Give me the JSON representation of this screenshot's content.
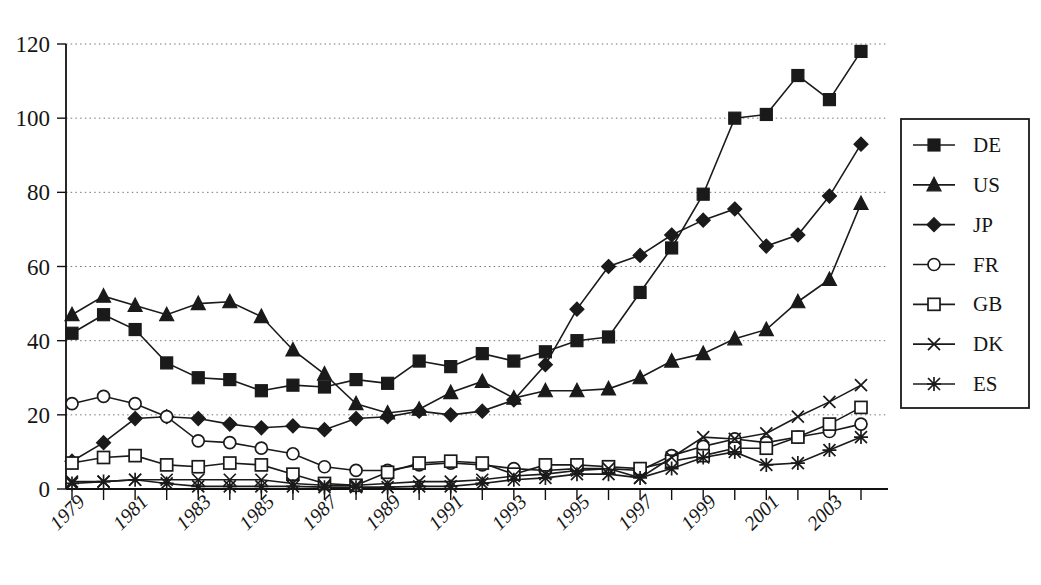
{
  "chart_data": {
    "type": "line",
    "title": "",
    "xlabel": "",
    "ylabel": "",
    "ylim": [
      0,
      120
    ],
    "yticks": [
      0,
      20,
      40,
      60,
      80,
      100,
      120
    ],
    "grid": true,
    "legend_position": "right",
    "x": [
      1979,
      1980,
      1981,
      1982,
      1983,
      1984,
      1985,
      1986,
      1987,
      1988,
      1989,
      1990,
      1991,
      1992,
      1993,
      1994,
      1995,
      1996,
      1997,
      1998,
      1999,
      2000,
      2001,
      2002,
      2003,
      2004
    ],
    "xtick_labels": [
      "1979",
      "1981",
      "1983",
      "1985",
      "1987",
      "1989",
      "1991",
      "1993",
      "1995",
      "1997",
      "1999",
      "2001",
      "2003"
    ],
    "xtick_values": [
      1979,
      1981,
      1983,
      1985,
      1987,
      1989,
      1991,
      1993,
      1995,
      1997,
      1999,
      2001,
      2003
    ],
    "series": [
      {
        "name": "DE",
        "marker": "filled-square",
        "values": [
          42,
          47,
          43,
          34,
          30,
          29.5,
          26.5,
          28,
          27.5,
          29.5,
          28.5,
          34.5,
          33,
          36.5,
          34.5,
          37,
          40,
          41,
          53,
          65,
          79.5,
          100,
          101,
          111.5,
          105,
          118
        ]
      },
      {
        "name": "US",
        "marker": "filled-triangle",
        "values": [
          47,
          52,
          49.5,
          47,
          50,
          50.5,
          46.5,
          37.5,
          31,
          23,
          20.5,
          21.5,
          26,
          29,
          24.5,
          26.5,
          26.5,
          27,
          30,
          34.5,
          36.5,
          40.5,
          43,
          50.5,
          56.5,
          77
        ]
      },
      {
        "name": "JP",
        "marker": "filled-diamond",
        "values": [
          7.5,
          12.5,
          19,
          19.5,
          19,
          17.5,
          16.5,
          17,
          16,
          19,
          19.5,
          21,
          20,
          21,
          24,
          33.5,
          48.5,
          60,
          63,
          68.5,
          72.5,
          75.5,
          65.5,
          68.5,
          79,
          93
        ]
      },
      {
        "name": "FR",
        "marker": "open-circle",
        "values": [
          23,
          25,
          23,
          19.5,
          13,
          12.5,
          11,
          9.5,
          6,
          5,
          5,
          6.5,
          7,
          6.5,
          5.5,
          5,
          5.5,
          5.5,
          5,
          9,
          11.5,
          13.5,
          12.5,
          14,
          15.5,
          17.5
        ]
      },
      {
        "name": "GB",
        "marker": "open-square",
        "values": [
          7,
          8.5,
          9,
          6.5,
          6,
          7,
          6.5,
          4,
          1.5,
          1,
          4.5,
          7,
          7.5,
          7,
          4,
          6.5,
          6.5,
          6,
          5.5,
          7.5,
          9,
          11,
          11,
          14,
          17.5,
          22
        ]
      },
      {
        "name": "DK",
        "marker": "cross",
        "values": [
          2,
          2,
          2.5,
          2.5,
          2.5,
          2.5,
          2.5,
          1.5,
          1,
          1,
          1.5,
          2,
          2,
          2.5,
          3.5,
          4,
          5,
          5.5,
          3,
          8.5,
          14,
          13.5,
          15,
          19.5,
          23.5,
          28
        ]
      },
      {
        "name": "ES",
        "marker": "asterisk",
        "values": [
          1.5,
          2,
          2.5,
          1.5,
          0.7,
          0.7,
          0.7,
          0.7,
          0.5,
          0.5,
          0.5,
          0.7,
          0.7,
          1.5,
          2.5,
          3,
          4,
          4,
          3,
          5.5,
          8.5,
          10,
          6.5,
          7,
          10.5,
          14
        ]
      }
    ],
    "legend_entries": [
      {
        "label": "DE",
        "marker": "filled-square"
      },
      {
        "label": "US",
        "marker": "filled-triangle"
      },
      {
        "label": "JP",
        "marker": "filled-diamond"
      },
      {
        "label": "FR",
        "marker": "open-circle"
      },
      {
        "label": "GB",
        "marker": "open-square"
      },
      {
        "label": "DK",
        "marker": "cross"
      },
      {
        "label": "ES",
        "marker": "asterisk"
      }
    ],
    "colors": {
      "ink": "#1a1a1a",
      "grid": "#777777",
      "background": "#ffffff"
    }
  }
}
